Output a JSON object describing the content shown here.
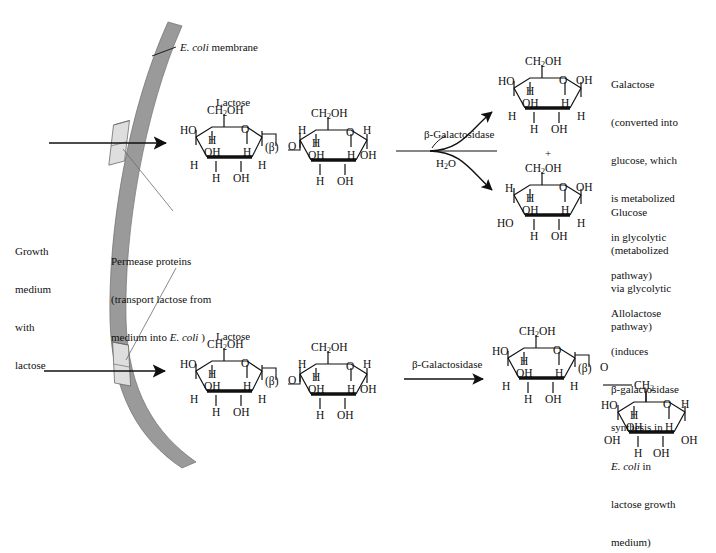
{
  "diagram": {
    "membrane_color": "#9a9a9a",
    "permease_color": "#d8d8d8",
    "line_color": "#101010",
    "bond_bold_color": "#000000"
  },
  "labels": {
    "membrane": {
      "italic": "E. coli",
      "rest": " membrane"
    },
    "growth_medium": [
      "Growth",
      "medium",
      "with",
      "lactose"
    ],
    "permease": {
      "line1": "Permease proteins",
      "line2": "(transport lactose from",
      "line3a": "medium into ",
      "line3b": "E. coli",
      "line3c": " )"
    },
    "lactose_top": "Lactose",
    "lactose_bottom": "Lactose",
    "enzyme_top": "β-Galactosidase",
    "enzyme_bottom": "β-Galactosidase",
    "water": "H",
    "water_sub": "2",
    "water_tail": "O",
    "plus": "+",
    "galactose": [
      "Galactose",
      "(converted into",
      "glucose, which",
      "is metabolized",
      "in glycolytic",
      "pathway)"
    ],
    "glucose": [
      "Glucose",
      "(metabolized",
      "via glycolytic",
      "pathway)"
    ],
    "allolactose": {
      "l1": "Allolactose",
      "l2": "(induces",
      "l3": "β-galactosidase",
      "l4": "synthesis in",
      "l5a": "E. coli",
      "l5b": " in",
      "l6": "lactose growth",
      "l7": "medium)"
    }
  },
  "chem": {
    "ch2oh": "CH",
    "ch2oh_sub": "2",
    "ch2oh_tail": "OH",
    "ch2": "CH",
    "ch2_sub": "2",
    "ho": "HO",
    "oh": "OH",
    "o": "O",
    "h": "H",
    "beta": "(β)"
  },
  "molecules": {
    "lactose_top": {
      "name": "Lactose",
      "ring_left": {
        "top_label": "CH2OH",
        "upper_left": "HO",
        "ring_o": "O",
        "inner_h": "H",
        "inner_oh": "OH",
        "inner_h2": "H",
        "lower_left": "H",
        "lower_right": "H",
        "bottom_left": "H",
        "bottom_right": "OH",
        "link": "(β)"
      },
      "ring_right": {
        "top_label": "CH2OH",
        "upper_left": "H",
        "ring_o": "O",
        "upper_right": "H",
        "inner_h": "H",
        "inner_oh": "OH",
        "inner_h2": "H",
        "lower_right": "OH",
        "bottom_left": "H",
        "bottom_right": "OH"
      }
    },
    "galactose": {
      "name": "Galactose",
      "top_label": "CH2OH",
      "upper_left": "HO",
      "ring_o": "O",
      "anomeric_oh": "OH",
      "inner_h": "H",
      "inner_oh": "OH",
      "inner_h2": "H",
      "lower_left": "H",
      "lower_right": "H",
      "bottom_left": "H",
      "bottom_right": "OH"
    },
    "glucose": {
      "name": "Glucose",
      "top_label": "CH2OH",
      "upper_left": "H",
      "ring_o": "O",
      "anomeric_oh": "OH",
      "inner_h": "H",
      "inner_oh": "OH",
      "inner_h2": "H",
      "lower_left": "HO",
      "lower_right": "H",
      "bottom_left": "H",
      "bottom_right": "OH"
    },
    "lactose_bottom": {
      "name": "Lactose",
      "ring_left": {
        "top_label": "CH2OH",
        "upper_left": "HO",
        "ring_o": "O",
        "inner_h": "H",
        "inner_oh": "OH",
        "inner_h2": "H",
        "lower_left": "H",
        "lower_right": "H",
        "bottom_left": "H",
        "bottom_right": "OH",
        "link": "(β)"
      },
      "ring_right": {
        "top_label": "CH2OH",
        "upper_left": "H",
        "ring_o": "O",
        "upper_right": "H",
        "inner_h": "H",
        "inner_oh": "OH",
        "inner_h2": "H",
        "lower_right": "OH",
        "bottom_left": "H",
        "bottom_right": "OH"
      }
    },
    "allolactose": {
      "name": "Allolactose",
      "ring_upper": {
        "top_label": "CH2OH",
        "upper_left": "HO",
        "ring_o": "O",
        "inner_h": "H",
        "inner_oh": "OH",
        "inner_h2": "H",
        "lower_left": "H",
        "lower_right": "H",
        "bottom_left": "H",
        "bottom_right": "OH",
        "link": "(β)"
      },
      "ring_lower": {
        "top_label": "CH2",
        "upper_left": "HO",
        "ring_o": "O",
        "upper_right": "H",
        "inner_h": "H",
        "inner_oh": "OH",
        "inner_h2": "H",
        "lower_left": "OH",
        "lower_right": "OH",
        "bottom_left": "H",
        "bottom_right": "OH"
      }
    }
  }
}
